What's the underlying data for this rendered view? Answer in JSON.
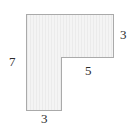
{
  "figure": {
    "name": "l-shaped-polygon",
    "fill_color": "#f2f2f2",
    "stroke_color": "#aaaaaa",
    "hatch_color": "#e6e6e6",
    "background_color": "#ffffff",
    "polygon_points": "26,14 113,14 113,57 61,57 61,110 26,110",
    "labels": {
      "left": "7",
      "right": "3",
      "inner_bottom": "5",
      "bottom": "3"
    }
  },
  "chart_data": {
    "type": "diagram",
    "title": "",
    "shape": "L-shape",
    "vertices": [
      {
        "x": 0,
        "y": 7
      },
      {
        "x": 8,
        "y": 7
      },
      {
        "x": 8,
        "y": 4
      },
      {
        "x": 3,
        "y": 4
      },
      {
        "x": 3,
        "y": 0
      },
      {
        "x": 0,
        "y": 0
      }
    ],
    "side_labels": [
      {
        "side": "left",
        "value": "7"
      },
      {
        "side": "right",
        "value": "3"
      },
      {
        "side": "inner-bottom",
        "value": "5"
      },
      {
        "side": "bottom",
        "value": "3"
      }
    ]
  }
}
